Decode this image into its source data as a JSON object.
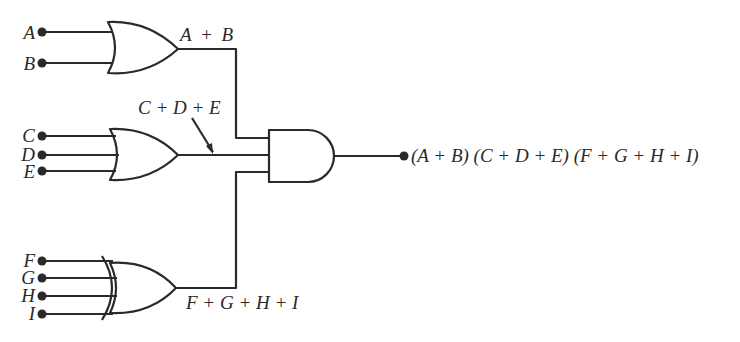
{
  "diagram": {
    "type": "logic-circuit",
    "colors": {
      "line": "#2a2a2a",
      "background": "#ffffff"
    },
    "inputs": {
      "A": "A",
      "B": "B",
      "C": "C",
      "D": "D",
      "E": "E",
      "F": "F",
      "G": "G",
      "H": "H",
      "I": "I"
    },
    "gates": [
      {
        "id": "or1",
        "kind": "OR",
        "inputs": [
          "A",
          "B"
        ],
        "output_label": "A + B"
      },
      {
        "id": "or2",
        "kind": "OR",
        "inputs": [
          "C",
          "D",
          "E"
        ],
        "output_label": "C + D + E"
      },
      {
        "id": "or3",
        "kind": "OR",
        "inputs": [
          "F",
          "G",
          "H",
          "I"
        ],
        "output_label": "F + G + H + I"
      },
      {
        "id": "and1",
        "kind": "AND",
        "inputs": [
          "or1",
          "or2",
          "or3"
        ],
        "output_label": "(A + B) (C + D + E) (F + G + H + I)"
      }
    ],
    "labels": {
      "or1_out": "A + B",
      "or2_out": "C + D + E",
      "or3_out": "F + G + H + I",
      "final_out": "(A + B) (C + D + E) (F + G + H + I)"
    }
  }
}
